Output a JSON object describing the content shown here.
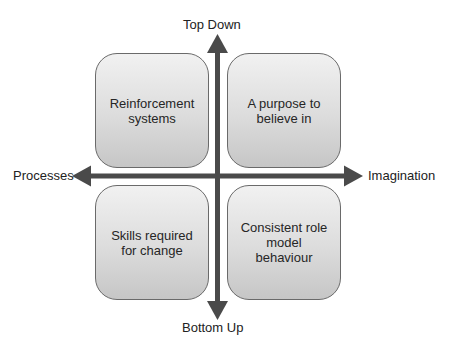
{
  "diagram": {
    "type": "quadrant-matrix",
    "axes": {
      "vertical": {
        "top_label": "Top Down",
        "bottom_label": "Bottom Up"
      },
      "horizontal": {
        "left_label": "Processes",
        "right_label": "Imagination"
      },
      "color": "#4a4a4a"
    },
    "quadrants": {
      "top_left": "Reinforcement systems",
      "top_right": "A purpose to believe in",
      "bottom_left": "Skills required for change",
      "bottom_right": "Consistent role model behaviour"
    },
    "quadrant_display": {
      "top_left": "Reinforcement\nsystems",
      "top_right": "A purpose to\nbelieve in",
      "bottom_left": "Skills required\nfor change",
      "bottom_right": "Consistent role\nmodel\nbehaviour"
    },
    "colors": {
      "box_fill_top": "#f1f1f1",
      "box_fill_bottom": "#c6c6c6",
      "box_border": "#6a6a6a",
      "text": "#262626"
    }
  }
}
